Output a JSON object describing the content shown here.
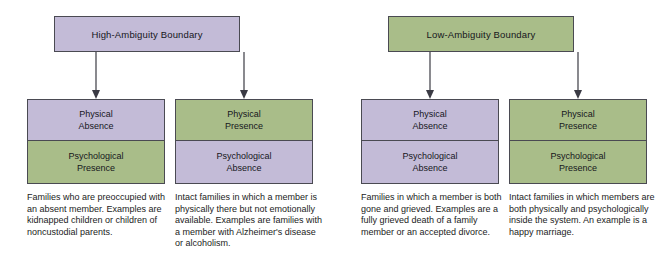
{
  "figure": {
    "colors": {
      "purple": "#c3bbd7",
      "green": "#a9bd89",
      "border": "#4a4a52",
      "text": "#16161c",
      "background": "#ffffff"
    }
  },
  "groups": [
    {
      "id": "high-ambiguity",
      "header": "High-Ambiguity Boundary",
      "header_fill": "purple",
      "columns": [
        {
          "id": "physical-absence-psychological-presence",
          "top_cell": {
            "line1": "Physical",
            "line2": "Absence",
            "fill": "purple"
          },
          "bottom_cell": {
            "line1": "Psychological",
            "line2": "Presence",
            "fill": "green"
          },
          "caption": "Families who are preoccupied with an absent member. Examples are kidnapped children or children of noncustodial parents."
        },
        {
          "id": "physical-presence-psychological-absence",
          "top_cell": {
            "line1": "Physical",
            "line2": "Presence",
            "fill": "green"
          },
          "bottom_cell": {
            "line1": "Psychological",
            "line2": "Absence",
            "fill": "purple"
          },
          "caption": "Intact families in which a member is physically there but not emotionally available. Examples are families with a member with Alzheimer's disease or alcoholism."
        }
      ]
    },
    {
      "id": "low-ambiguity",
      "header": "Low-Ambiguity Boundary",
      "header_fill": "green",
      "columns": [
        {
          "id": "physical-absence-psychological-absence",
          "top_cell": {
            "line1": "Physical",
            "line2": "Absence",
            "fill": "purple"
          },
          "bottom_cell": {
            "line1": "Psychological",
            "line2": "Absence",
            "fill": "purple"
          },
          "caption": "Families in which a member is both gone and grieved. Examples are a fully grieved death of a family member or an accepted divorce."
        },
        {
          "id": "physical-presence-psychological-presence",
          "top_cell": {
            "line1": "Physical",
            "line2": "Presence",
            "fill": "green"
          },
          "bottom_cell": {
            "line1": "Psychological",
            "line2": "Presence",
            "fill": "green"
          },
          "caption": "Intact families in which members are both physically and psychologically inside the system. An example is a happy marriage."
        }
      ]
    }
  ]
}
